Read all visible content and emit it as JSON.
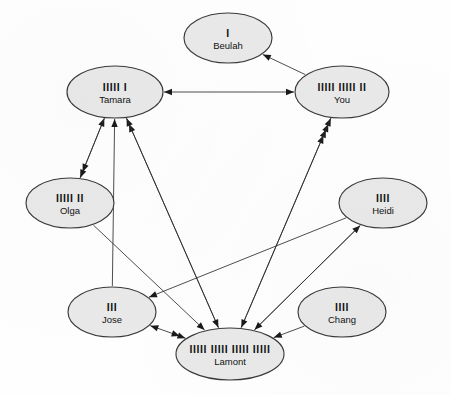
{
  "figure": {
    "type": "sociogram",
    "background_color": "#fefefe",
    "node_fill": "#e9e9e9",
    "node_stroke": "#3a3a3a",
    "edge_color": "#2e2e2e"
  },
  "nodes": [
    {
      "id": "beulah",
      "name": "Beulah",
      "tally": "I",
      "count": 1,
      "cx": 228,
      "cy": 38,
      "rx": 44,
      "ry": 25
    },
    {
      "id": "tamara",
      "name": "Tamara",
      "tally": "IIIII I",
      "count": 6,
      "cx": 115,
      "cy": 92,
      "rx": 48,
      "ry": 26
    },
    {
      "id": "you",
      "name": "You",
      "tally": "IIIII IIIII II",
      "count": 12,
      "cx": 342,
      "cy": 92,
      "rx": 47,
      "ry": 26
    },
    {
      "id": "olga",
      "name": "Olga",
      "tally": "IIIII II",
      "count": 7,
      "cx": 70,
      "cy": 203,
      "rx": 44,
      "ry": 25
    },
    {
      "id": "heidi",
      "name": "Heidi",
      "tally": "IIII",
      "count": 4,
      "cx": 383,
      "cy": 203,
      "rx": 44,
      "ry": 25
    },
    {
      "id": "jose",
      "name": "Jose",
      "tally": "III",
      "count": 3,
      "cx": 112,
      "cy": 312,
      "rx": 44,
      "ry": 25
    },
    {
      "id": "chang",
      "name": "Chang",
      "tally": "IIII",
      "count": 4,
      "cx": 342,
      "cy": 312,
      "rx": 44,
      "ry": 25
    },
    {
      "id": "lamont",
      "name": "Lamont",
      "tally": "IIIII IIIII IIIII IIIII",
      "count": 20,
      "cx": 230,
      "cy": 354,
      "rx": 54,
      "ry": 26
    }
  ],
  "edges": [
    {
      "from": "you",
      "to": "beulah",
      "heads": 1,
      "direction": "one-way"
    },
    {
      "from": "tamara",
      "to": "you",
      "heads": 1,
      "direction": "two-way"
    },
    {
      "from": "olga",
      "to": "tamara",
      "heads": 1,
      "direction": "one-way"
    },
    {
      "from": "lamont",
      "to": "tamara",
      "heads": 2,
      "direction": "one-way"
    },
    {
      "from": "jose",
      "to": "tamara",
      "heads": 1,
      "direction": "one-way"
    },
    {
      "from": "tamara",
      "to": "olga",
      "heads": 2,
      "direction": "one-way"
    },
    {
      "from": "lamont",
      "to": "you",
      "heads": 4,
      "direction": "one-way"
    },
    {
      "from": "lamont",
      "to": "heidi",
      "heads": 1,
      "direction": "one-way"
    },
    {
      "from": "heidi",
      "to": "jose",
      "heads": 1,
      "direction": "one-way"
    },
    {
      "from": "jose",
      "to": "lamont",
      "heads": 2,
      "direction": "two-way"
    },
    {
      "from": "chang",
      "to": "lamont",
      "heads": 1,
      "direction": "one-way"
    },
    {
      "from": "tamara",
      "to": "lamont",
      "heads": 1,
      "direction": "one-way"
    },
    {
      "from": "olga",
      "to": "lamont",
      "heads": 1,
      "direction": "one-way"
    },
    {
      "from": "you",
      "to": "lamont",
      "heads": 1,
      "direction": "one-way"
    },
    {
      "from": "heidi",
      "to": "lamont",
      "heads": 1,
      "direction": "one-way"
    }
  ]
}
